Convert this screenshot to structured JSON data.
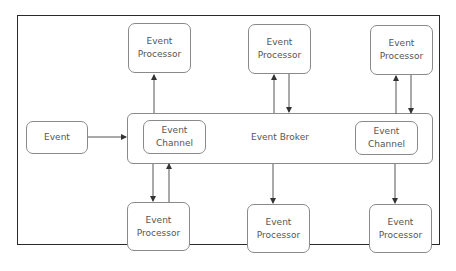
{
  "diagram": {
    "type": "event-driven architecture (broker topology)",
    "event": {
      "label": "Event"
    },
    "broker": {
      "label": "Event Broker",
      "channels": [
        {
          "line1": "Event",
          "line2": "Channel"
        },
        {
          "line1": "Event",
          "line2": "Channel"
        }
      ]
    },
    "processors_top": [
      {
        "line1": "Event",
        "line2": "Processor"
      },
      {
        "line1": "Event",
        "line2": "Processor"
      },
      {
        "line1": "Event",
        "line2": "Processor"
      }
    ],
    "processors_bottom": [
      {
        "line1": "Event",
        "line2": "Processor"
      },
      {
        "line1": "Event",
        "line2": "Processor"
      },
      {
        "line1": "Event",
        "line2": "Processor"
      }
    ],
    "connections": [
      {
        "from": "Event",
        "to": "Event Broker",
        "direction": "one-way"
      },
      {
        "from": "Event Broker",
        "to": "Event Processor (top-left)",
        "direction": "one-way"
      },
      {
        "from": "Event Broker",
        "to": "Event Processor (top-middle)",
        "direction": "two-way"
      },
      {
        "from": "Event Broker",
        "to": "Event Processor (top-right)",
        "direction": "two-way"
      },
      {
        "from": "Event Broker",
        "to": "Event Processor (bottom-left)",
        "direction": "two-way"
      },
      {
        "from": "Event Broker",
        "to": "Event Processor (bottom-middle)",
        "direction": "one-way"
      },
      {
        "from": "Event Broker",
        "to": "Event Processor (bottom-right)",
        "direction": "one-way"
      }
    ],
    "colors": {
      "frame": "#2a2a2a",
      "box_border": "#8a8a8a",
      "text": "#555555",
      "arrow": "#444444"
    }
  }
}
